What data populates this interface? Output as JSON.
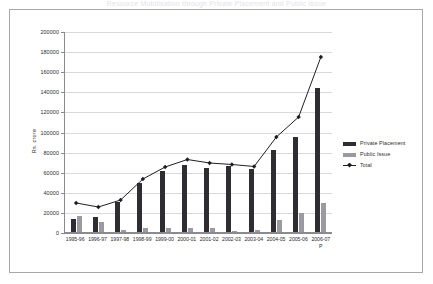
{
  "title_strip": "Resource Mobilisation through Private Placement and Public Issue",
  "legend": {
    "position": "right",
    "items": [
      {
        "label": "Private Placement",
        "swatch": "private-placement-swatch",
        "color": "#2e2e32"
      },
      {
        "label": "Public Issue",
        "swatch": "public-issue-swatch",
        "color": "#9a9aa0"
      },
      {
        "label": "Total",
        "swatch": "total-line-swatch",
        "color": "#1e1e22"
      }
    ]
  },
  "axis": {
    "y_title": "Rs. crore",
    "y_ticks": [
      "200000",
      "180000",
      "160000",
      "140000",
      "120000",
      "100000",
      "80000",
      "60000",
      "40000",
      "20000",
      "0"
    ]
  },
  "chart_data": {
    "type": "bar",
    "title": "Resource Mobilisation through Private Placement and Public Issue",
    "xlabel": "",
    "ylabel": "Rs. crore",
    "ylim": [
      0,
      200000
    ],
    "ytick_step": 20000,
    "grid": true,
    "legend_position": "right",
    "categories": [
      "1995-96",
      "1996-97",
      "1997-98",
      "1998-99",
      "1999-00",
      "2000-01",
      "2001-02",
      "2002-03",
      "2003-04",
      "2004-05",
      "2005-06",
      "2006-07 P"
    ],
    "category_lines": [
      [
        "1995-96",
        ""
      ],
      [
        "1996-97",
        ""
      ],
      [
        "1997-98",
        ""
      ],
      [
        "1998-99",
        ""
      ],
      [
        "1999-00",
        ""
      ],
      [
        "2000-01",
        ""
      ],
      [
        "2001-02",
        ""
      ],
      [
        "2002-03",
        ""
      ],
      [
        "2003-04",
        ""
      ],
      [
        "2004-05",
        ""
      ],
      [
        "2005-06",
        ""
      ],
      [
        "2006-07",
        "P"
      ]
    ],
    "series": [
      {
        "name": "Private Placement",
        "kind": "bar",
        "color": "#2e2e32",
        "values": [
          13400,
          15000,
          30000,
          49000,
          61000,
          67000,
          64000,
          66000,
          63000,
          82000,
          95000,
          143000
        ]
      },
      {
        "name": "Public Issue",
        "kind": "bar",
        "color": "#9a9aa0",
        "values": [
          15500,
          10000,
          2300,
          4000,
          3800,
          4400,
          4100,
          1000,
          2000,
          11500,
          19000,
          29000
        ]
      },
      {
        "name": "Total",
        "kind": "line",
        "color": "#1e1e22",
        "marker": "diamond",
        "values": [
          29000,
          25000,
          32000,
          53000,
          65000,
          72500,
          69000,
          67500,
          65500,
          95000,
          115000,
          175000
        ]
      }
    ]
  }
}
